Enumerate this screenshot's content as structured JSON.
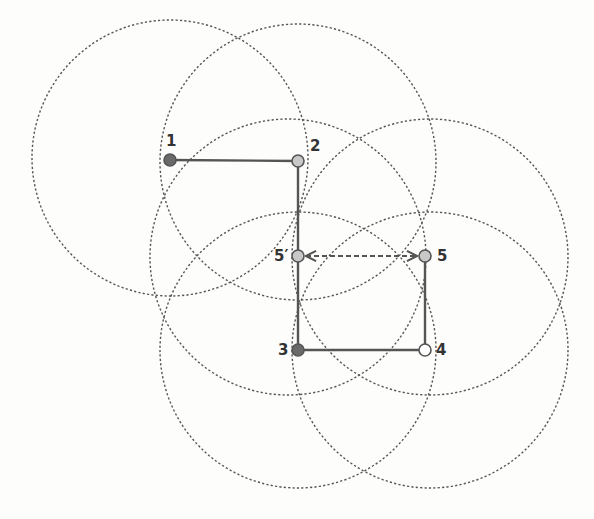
{
  "diagram": {
    "title": "",
    "colors": {
      "background": "#fdfdfc",
      "circle_stroke": "#555555",
      "edge_stroke": "#555555",
      "node_dark": "#6a6a6a",
      "node_light": "#c8c8c8",
      "node_white": "#ffffff",
      "node_outline": "#555555",
      "label": "#333333"
    },
    "circle_radius": 138,
    "circles": [
      {
        "id": "c1",
        "cx": 170,
        "cy": 158
      },
      {
        "id": "c2",
        "cx": 298,
        "cy": 162
      },
      {
        "id": "c5p",
        "cx": 288,
        "cy": 257
      },
      {
        "id": "c5",
        "cx": 430,
        "cy": 257
      },
      {
        "id": "c3",
        "cx": 298,
        "cy": 350
      },
      {
        "id": "c4",
        "cx": 430,
        "cy": 350
      }
    ],
    "nodes": [
      {
        "id": "1",
        "label": "1",
        "x": 170,
        "y": 160,
        "style": "dark",
        "label_dx": -4,
        "label_dy": -14
      },
      {
        "id": "2",
        "label": "2",
        "x": 298,
        "y": 161,
        "style": "light",
        "label_dx": 12,
        "label_dy": -10
      },
      {
        "id": "5p",
        "label": "5′",
        "x": 298,
        "y": 256,
        "style": "light",
        "label_dx": -24,
        "label_dy": 5
      },
      {
        "id": "5",
        "label": "5",
        "x": 425,
        "y": 256,
        "style": "light",
        "label_dx": 12,
        "label_dy": 5
      },
      {
        "id": "3",
        "label": "3",
        "x": 298,
        "y": 350,
        "style": "dark",
        "label_dx": -20,
        "label_dy": 5
      },
      {
        "id": "4",
        "label": "4",
        "x": 425,
        "y": 350,
        "style": "white",
        "label_dx": 11,
        "label_dy": 5
      }
    ],
    "edges": [
      {
        "from": "1",
        "to": "2",
        "style": "solid"
      },
      {
        "from": "2",
        "to": "5p",
        "style": "solid"
      },
      {
        "from": "5p",
        "to": "3",
        "style": "solid"
      },
      {
        "from": "3",
        "to": "4",
        "style": "solid"
      },
      {
        "from": "4",
        "to": "5",
        "style": "solid"
      },
      {
        "from": "5p",
        "to": "5",
        "style": "dashed-double-arrow"
      }
    ]
  }
}
